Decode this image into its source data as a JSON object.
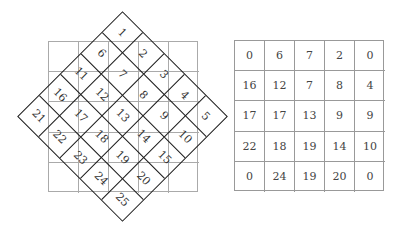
{
  "diagram": {
    "left_figure": {
      "description": "5x5 numbered grid rotated 45 degrees over a light 5x5 square grid",
      "rotated_cells": [
        [
          "1",
          "2",
          "3",
          "4",
          "5"
        ],
        [
          "6",
          "7",
          "8",
          "9",
          "10"
        ],
        [
          "11",
          "12",
          "13",
          "14",
          "15"
        ],
        [
          "16",
          "17",
          "18",
          "19",
          "20"
        ],
        [
          "21",
          "22",
          "23",
          "24",
          "25"
        ]
      ],
      "rotation_deg": 45
    },
    "right_table": {
      "rows": [
        [
          "0",
          "6",
          "7",
          "2",
          "0"
        ],
        [
          "16",
          "12",
          "7",
          "8",
          "4"
        ],
        [
          "17",
          "17",
          "13",
          "9",
          "9"
        ],
        [
          "22",
          "18",
          "19",
          "14",
          "10"
        ],
        [
          "0",
          "24",
          "19",
          "20",
          "0"
        ]
      ]
    },
    "colors": {
      "diamond_lines": "#1a1a1a",
      "background_grid": "#aaaaaa",
      "table_lines": "#999999"
    }
  }
}
